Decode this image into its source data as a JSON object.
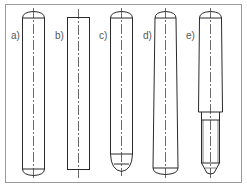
{
  "figure": {
    "colors": {
      "line": "#2a2a2a",
      "frame": "#9a9a9a",
      "label": "#555555",
      "background": "#ffffff"
    },
    "pins": [
      {
        "label": "a)",
        "type": "cylindrical pin, domed both ends"
      },
      {
        "label": "b)",
        "type": "cylindrical pin, flat ends"
      },
      {
        "label": "c)",
        "type": "cylindrical pin, domed top, rounded chamfered bottom"
      },
      {
        "label": "d)",
        "type": "taper pin, domed ends"
      },
      {
        "label": "e)",
        "type": "taper pin with threaded end"
      }
    ]
  }
}
